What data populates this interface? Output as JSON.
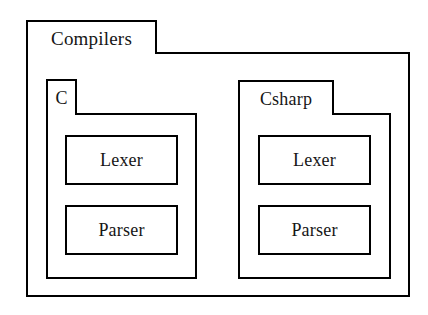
{
  "diagram": {
    "type": "uml-package-diagram",
    "background_color": "#ffffff",
    "stroke_color": "#000000",
    "text_color": "#161616"
  },
  "packages": {
    "compilers": {
      "name": "Compilers",
      "children": [
        "c",
        "csharp"
      ]
    },
    "c": {
      "name": "C",
      "classes": [
        "Lexer",
        "Parser"
      ]
    },
    "csharp": {
      "name": "Csharp",
      "classes": [
        "Lexer",
        "Parser"
      ]
    }
  },
  "classes": {
    "c_lexer": {
      "name": "Lexer"
    },
    "c_parser": {
      "name": "Parser"
    },
    "csharp_lexer": {
      "name": "Lexer"
    },
    "csharp_parser": {
      "name": "Parser"
    }
  }
}
